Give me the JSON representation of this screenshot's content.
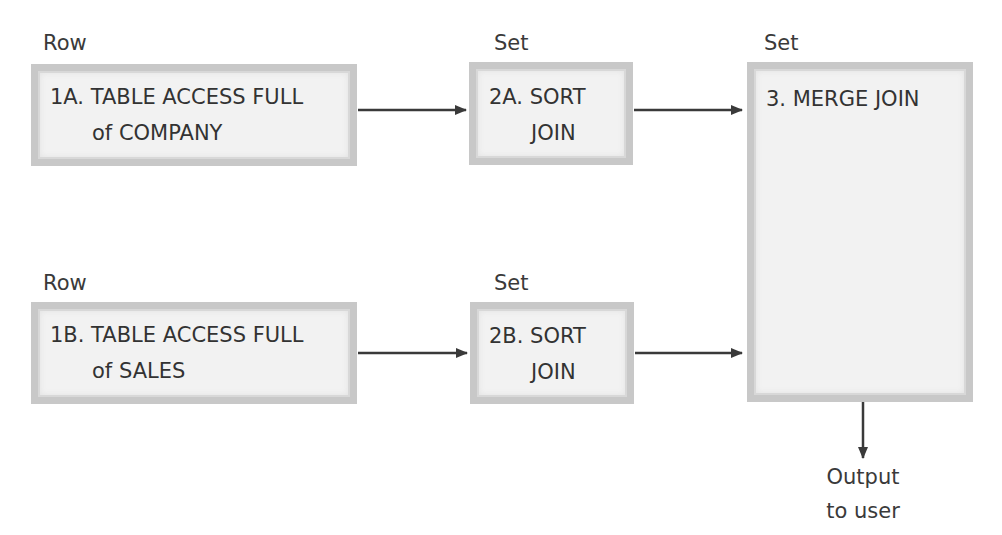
{
  "diagram": {
    "type": "flowchart",
    "colors": {
      "box_fill": "#f2f2f2",
      "box_border": "#c8c8c8",
      "text": "#333333",
      "arrow": "#3a3a3a"
    },
    "nodes": [
      {
        "id": "1A",
        "type_label": "Row",
        "line1": "1A. TABLE ACCESS FULL",
        "line2": "of COMPANY"
      },
      {
        "id": "2A",
        "type_label": "Set",
        "line1": "2A. SORT",
        "line2": "JOIN"
      },
      {
        "id": "1B",
        "type_label": "Row",
        "line1": "1B. TABLE ACCESS FULL",
        "line2": "of SALES"
      },
      {
        "id": "2B",
        "type_label": "Set",
        "line1": "2B. SORT",
        "line2": "JOIN"
      },
      {
        "id": "3",
        "type_label": "Set",
        "line1": "3. MERGE JOIN"
      }
    ],
    "edges": [
      {
        "from": "1A",
        "to": "2A"
      },
      {
        "from": "2A",
        "to": "3"
      },
      {
        "from": "1B",
        "to": "2B"
      },
      {
        "from": "2B",
        "to": "3"
      },
      {
        "from": "3",
        "to": "output"
      }
    ],
    "output": {
      "line1": "Output",
      "line2": "to user"
    }
  }
}
